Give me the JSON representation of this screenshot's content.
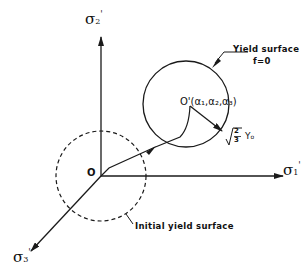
{
  "diagram": {
    "axes": {
      "sigma1": {
        "symbol": "σ",
        "subscript": "1",
        "prime": "'"
      },
      "sigma2": {
        "symbol": "σ",
        "subscript": "2",
        "prime": "'"
      },
      "sigma3": {
        "symbol": "σ",
        "subscript": "3",
        "prime": "'"
      }
    },
    "origin_label": "O",
    "center_label": "O'(α₁,α₂,α₃)",
    "radius_label": {
      "root": "√",
      "fraction": "2/3",
      "numerator": "2",
      "denominator": "3",
      "variable": "Y",
      "variable_sub": "o"
    },
    "yield_surface_label": {
      "line1": "Yield surface",
      "line2": "f=0"
    },
    "initial_surface_label": "Initial yield surface",
    "colors": {
      "ink": "#1a1a1a",
      "background": "#ffffff"
    }
  }
}
